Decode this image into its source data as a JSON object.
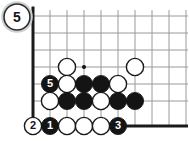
{
  "diagram": {
    "kind": "go-board-corner-diagram",
    "move_label": "5",
    "colors": {
      "background": "#ffffff",
      "grid_line": "#9a9a9a",
      "board_edge": "#1a1a1a",
      "black_stone": "#141414",
      "white_stone": "#ffffff",
      "white_stone_outline": "#1a1a1a",
      "label_on_black": "#ffffff",
      "label_on_white": "#141414",
      "corner_badge_fill": "#ffffff",
      "corner_badge_outline": "#2b2b2b",
      "star_point": "#141414"
    },
    "geometry": {
      "cell": 17,
      "stone_radius": 8.6,
      "origin_x": 33,
      "origin_y": 126,
      "cols": 10,
      "rows": 7
    }
  },
  "corner_badge": {
    "label": "5",
    "name": "diagram-number-badge",
    "cx": 17,
    "cy": 17,
    "r": 13
  },
  "grid": {
    "vertical_lines_x": [
      33,
      50,
      67,
      84,
      101,
      118,
      135,
      152,
      169,
      186
    ],
    "horizontal_lines_y": [
      16,
      33,
      50,
      67,
      84,
      101,
      126
    ],
    "left_edge_x": 33,
    "bottom_edge_y": 126,
    "edge_thickness": 3,
    "line_thickness": 1
  },
  "star_points": [
    {
      "name": "star-point-4-4",
      "x": 84,
      "y": 67
    }
  ],
  "stones": [
    {
      "id": "w-a",
      "color": "white",
      "x": 67,
      "y": 67,
      "label": ""
    },
    {
      "id": "w-b",
      "color": "white",
      "x": 135,
      "y": 67,
      "label": ""
    },
    {
      "id": "b-5",
      "color": "black",
      "x": 50,
      "y": 84,
      "label": "5"
    },
    {
      "id": "w-c",
      "color": "white",
      "x": 67,
      "y": 84,
      "label": ""
    },
    {
      "id": "b-c",
      "color": "black",
      "x": 84,
      "y": 84,
      "label": ""
    },
    {
      "id": "b-d",
      "color": "black",
      "x": 101,
      "y": 84,
      "label": ""
    },
    {
      "id": "w-d",
      "color": "white",
      "x": 118,
      "y": 84,
      "label": ""
    },
    {
      "id": "w-e",
      "color": "white",
      "x": 50,
      "y": 101,
      "label": ""
    },
    {
      "id": "b-e",
      "color": "black",
      "x": 67,
      "y": 101,
      "label": ""
    },
    {
      "id": "b-f",
      "color": "black",
      "x": 84,
      "y": 101,
      "label": ""
    },
    {
      "id": "w-f",
      "color": "white",
      "x": 101,
      "y": 101,
      "label": ""
    },
    {
      "id": "b-g",
      "color": "black",
      "x": 118,
      "y": 101,
      "label": ""
    },
    {
      "id": "b-h",
      "color": "black",
      "x": 135,
      "y": 101,
      "label": ""
    },
    {
      "id": "w-2",
      "color": "white",
      "x": 33,
      "y": 126,
      "label": "2"
    },
    {
      "id": "b-1",
      "color": "black",
      "x": 50,
      "y": 126,
      "label": "1"
    },
    {
      "id": "w-g",
      "color": "white",
      "x": 67,
      "y": 126,
      "label": ""
    },
    {
      "id": "w-h",
      "color": "white",
      "x": 84,
      "y": 126,
      "label": ""
    },
    {
      "id": "w-i",
      "color": "white",
      "x": 101,
      "y": 126,
      "label": ""
    },
    {
      "id": "b-3",
      "color": "black",
      "x": 118,
      "y": 126,
      "label": "3"
    }
  ]
}
